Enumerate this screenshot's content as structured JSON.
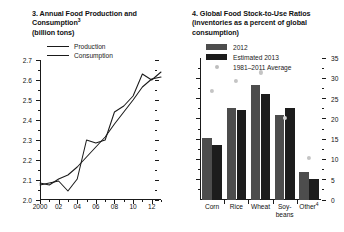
{
  "left_panel": {
    "title_lines": [
      "3. Annual Food Production and",
      "Consumption"
    ],
    "title_superscript": "3",
    "subtitle": "(billion tons)",
    "legend": [
      {
        "label": "Production"
      },
      {
        "label": "Consumption"
      }
    ]
  },
  "right_panel": {
    "title_lines": [
      "4. Global Food Stock-to-Use Ratios",
      "(inventories as a percent of global",
      "consumption)"
    ],
    "legend": [
      {
        "label": "2012",
        "marker": "bar-swatch-medium",
        "color": "#4d4d4d"
      },
      {
        "label": "Estimated 2013",
        "marker": "bar-swatch-dark",
        "color": "#1c1c1c"
      },
      {
        "label": "1981–2011 Average",
        "marker": "dot",
        "color": "#bdbdbd"
      }
    ]
  },
  "chart_data": [
    {
      "type": "line",
      "title": "3. Annual Food Production and Consumption3",
      "subtitle": "(billion tons)",
      "xlabel": "",
      "ylabel": "",
      "ylim": [
        2.0,
        2.7
      ],
      "ytick_values": [
        2.0,
        2.1,
        2.2,
        2.3,
        2.4,
        2.5,
        2.6,
        2.7
      ],
      "ytick_labels": [
        "2.0",
        "2.1",
        "2.2",
        "2.3",
        "2.4",
        "2.5",
        "2.6",
        "2.7"
      ],
      "y_minor_step": 0.05,
      "xlim": [
        2000,
        2013
      ],
      "x": [
        2000,
        2001,
        2002,
        2003,
        2004,
        2005,
        2006,
        2007,
        2008,
        2009,
        2010,
        2011,
        2012,
        2013
      ],
      "xtick_values": [
        2000,
        2002,
        2004,
        2006,
        2008,
        2010,
        2012
      ],
      "xtick_labels": [
        "2000",
        "02",
        "04",
        "06",
        "08",
        "10",
        "12"
      ],
      "grid": false,
      "legend_position": "upper-left",
      "series": [
        {
          "name": "Production",
          "values": [
            2.075,
            2.085,
            2.095,
            2.045,
            2.105,
            2.3,
            2.285,
            2.3,
            2.44,
            2.47,
            2.52,
            2.63,
            2.6,
            2.64
          ]
        },
        {
          "name": "Consumption",
          "values": [
            2.085,
            2.075,
            2.105,
            2.125,
            2.165,
            2.215,
            2.265,
            2.315,
            2.38,
            2.44,
            2.5,
            2.565,
            2.605,
            2.615
          ]
        }
      ]
    },
    {
      "type": "bar",
      "title": "4. Global Food Stock-to-Use Ratios",
      "subtitle": "(inventories as a percent of global consumption)",
      "xlabel": "",
      "ylabel": "",
      "ylim": [
        0,
        35
      ],
      "ytick_values": [
        0,
        5,
        10,
        15,
        20,
        25,
        30,
        35
      ],
      "ytick_labels": [
        "0",
        "5",
        "10",
        "15",
        "20",
        "25",
        "30",
        "35"
      ],
      "y_minor_step": 2.5,
      "grid": false,
      "legend_position": "upper-left",
      "axis_side": "right",
      "categories": [
        "Corn",
        "Rice",
        "Wheat",
        "Soy-beans",
        "Other"
      ],
      "category_labels": [
        {
          "line1": "Corn",
          "line2": ""
        },
        {
          "line1": "Rice",
          "line2": ""
        },
        {
          "line1": "Wheat",
          "line2": ""
        },
        {
          "line1": "Soy-",
          "line2": "beans"
        },
        {
          "line1": "Other",
          "line2": "",
          "superscript": "4"
        }
      ],
      "series": [
        {
          "name": "2012",
          "values": [
            15.2,
            22.7,
            28.3,
            20.9,
            6.8
          ]
        },
        {
          "name": "Estimated 2013",
          "values": [
            13.6,
            22.2,
            26.1,
            22.6,
            5.3
          ]
        },
        {
          "name": "1981–2011 Average",
          "type": "scatter",
          "values": [
            26.8,
            29.4,
            31.4,
            20.2,
            10.3
          ]
        }
      ]
    }
  ]
}
